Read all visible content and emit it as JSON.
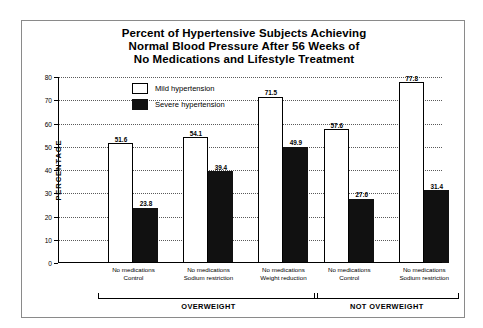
{
  "chart_data": {
    "type": "bar",
    "title": "Percent of Hypertensive Subjects Achieving Normal Blood Pressure After 56 Weeks of No Medications and Lifestyle Treatment",
    "title_lines": [
      "Percent of Hypertensive Subjects Achieving",
      "Normal Blood Pressure After 56 Weeks of",
      "No Medications and Lifestyle Treatment"
    ],
    "xlabel": "",
    "ylabel": "PERCENTAGE",
    "ylim": [
      0,
      80
    ],
    "ytick_labels": [
      "0",
      "10",
      "20",
      "30",
      "40",
      "50",
      "60",
      "70",
      "80"
    ],
    "ytick_values": [
      0,
      10,
      20,
      30,
      40,
      50,
      60,
      70,
      80
    ],
    "grid": true,
    "legend_position": "top-left-inside",
    "categories": [
      "No medications Control",
      "No medications Sodium restriction",
      "No medications Weight reduction",
      "No medications Control",
      "No medications Sodium restriction"
    ],
    "category_lines": [
      [
        "No medications",
        "Control"
      ],
      [
        "No medications",
        "Sodium restriction"
      ],
      [
        "No medications",
        "Weight reduction"
      ],
      [
        "No medications",
        "Control"
      ],
      [
        "No medications",
        "Sodium restriction"
      ]
    ],
    "series": [
      {
        "name": "Mild hypertension",
        "color": "#ffffff",
        "values": [
          51.6,
          54.1,
          71.5,
          57.6,
          77.8
        ]
      },
      {
        "name": "Severe hypertension",
        "color": "#111111",
        "values": [
          23.8,
          39.4,
          49.9,
          27.6,
          31.4
        ]
      }
    ],
    "value_labels": [
      "51.6",
      "23.8",
      "54.1",
      "39.4",
      "71.5",
      "49.9",
      "57.6",
      "27.6",
      "77.8",
      "31.4"
    ],
    "annotations": [
      {
        "label": "OVERWEIGHT",
        "covers": [
          0,
          1,
          2
        ]
      },
      {
        "label": "NOT OVERWEIGHT",
        "covers": [
          3,
          4
        ]
      }
    ]
  }
}
